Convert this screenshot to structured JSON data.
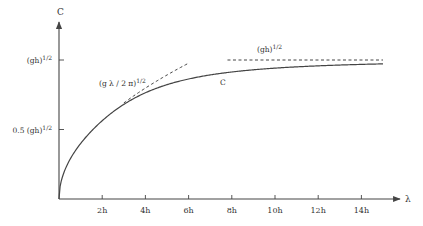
{
  "chart_data": {
    "type": "line",
    "title": "",
    "xlabel": "λ",
    "ylabel": "C",
    "xlim": [
      0,
      15.4
    ],
    "ylim": [
      0,
      1.27
    ],
    "x_unit": "h",
    "y_unit": "(gh)^1/2",
    "x_ticks": [
      {
        "value": 2,
        "label": "2h"
      },
      {
        "value": 4,
        "label": "4h"
      },
      {
        "value": 6,
        "label": "6h"
      },
      {
        "value": 8,
        "label": "8h"
      },
      {
        "value": 10,
        "label": "10h"
      },
      {
        "value": 12,
        "label": "12h"
      },
      {
        "value": 14,
        "label": "14h"
      }
    ],
    "y_ticks": [
      {
        "value": 0.5,
        "label_main": "0.5 (gh)",
        "label_sup": "1/2"
      },
      {
        "value": 1.0,
        "label_main": "(gh)",
        "label_sup": "1/2"
      }
    ],
    "series": [
      {
        "name": "C",
        "style": "solid",
        "formula": "sqrt(lambda/(2*pi) * tanh(2*pi/lambda))",
        "x": [
          0,
          0.25,
          0.5,
          1,
          1.5,
          2,
          3,
          4,
          5,
          6,
          7,
          8,
          10,
          12,
          14,
          15
        ],
        "values": [
          0,
          0.199,
          0.282,
          0.399,
          0.487,
          0.558,
          0.664,
          0.736,
          0.789,
          0.828,
          0.858,
          0.882,
          0.917,
          0.94,
          0.955,
          0.96
        ]
      },
      {
        "name": "(g λ / 2 π)^1/2",
        "style": "dashed",
        "note": "deep-water asymptote",
        "x": [
          3.0,
          6.0
        ],
        "values": [
          0.691,
          0.977
        ]
      },
      {
        "name": "(gh)^1/2",
        "style": "dashed",
        "note": "shallow-water limit",
        "x": [
          7.8,
          15.0
        ],
        "values": [
          1.0,
          1.0
        ]
      }
    ],
    "annotations": [
      {
        "text_main": "(g λ / 2 π)",
        "text_sup": "1/2",
        "near_series": "deep-water asymptote"
      },
      {
        "text_main": "(gh)",
        "text_sup": "1/2",
        "near_series": "shallow-water limit"
      },
      {
        "text": "C",
        "near_series": "C"
      }
    ],
    "grid": false,
    "legend": "none"
  },
  "labels": {
    "y_axis": "C",
    "x_axis": "λ",
    "deep_main": "(g λ / 2 π)",
    "deep_sup": "1/2",
    "shallow_main": "(gh)",
    "shallow_sup": "1/2",
    "curve": "C"
  }
}
